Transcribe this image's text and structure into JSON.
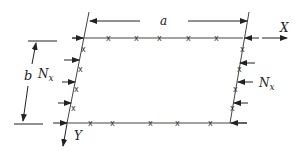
{
  "diagram": {
    "labels": {
      "a": "a",
      "b": "b",
      "X": "X",
      "Y": "Y",
      "Nx_left": "N",
      "Nx_left_sub": "x",
      "Nx_right": "N",
      "Nx_right_sub": "x"
    },
    "edge_marker": "x",
    "colors": {
      "line": "#333333",
      "text": "#222222",
      "background": "#ffffff"
    }
  }
}
